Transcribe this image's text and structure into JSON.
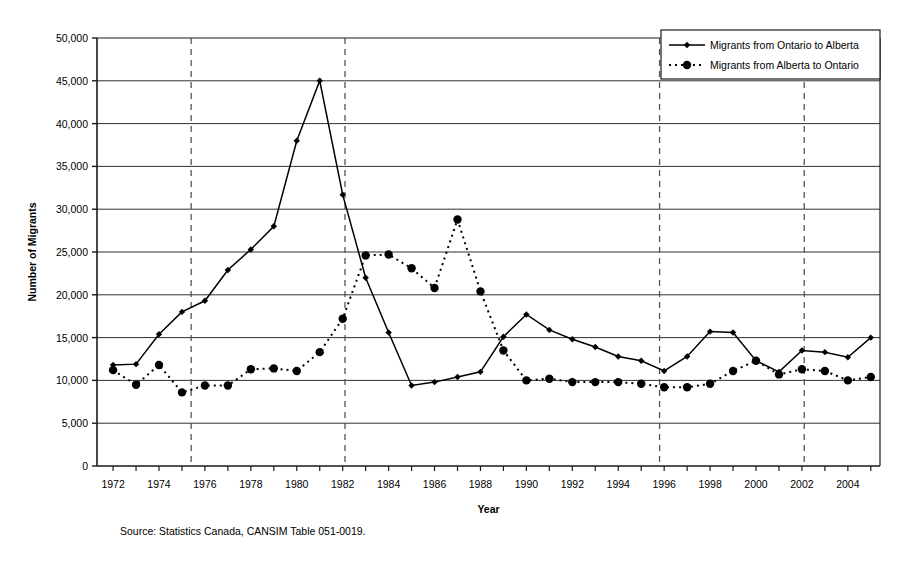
{
  "chart_data": {
    "type": "line",
    "title": "",
    "xlabel": "Year",
    "ylabel": "Number of Migrants",
    "xlim": [
      1971.3,
      2005.4
    ],
    "ylim": [
      0,
      50000
    ],
    "grid": "horizontal-solid-plus-dashed-vertical",
    "legend_position": "top-right",
    "x_tick_labels": [
      "1972",
      "1974",
      "1976",
      "1978",
      "1980",
      "1982",
      "1984",
      "1986",
      "1988",
      "1990",
      "1992",
      "1994",
      "1996",
      "1998",
      "2000",
      "2002",
      "2004"
    ],
    "x_tick_values": [
      1972,
      1974,
      1976,
      1978,
      1980,
      1982,
      1984,
      1986,
      1988,
      1990,
      1992,
      1994,
      1996,
      1998,
      2000,
      2002,
      2004
    ],
    "y_tick_labels": [
      "0",
      "5,000",
      "10,000",
      "15,000",
      "20,000",
      "25,000",
      "30,000",
      "35,000",
      "40,000",
      "45,000",
      "50,000"
    ],
    "y_tick_values": [
      0,
      5000,
      10000,
      15000,
      20000,
      25000,
      30000,
      35000,
      40000,
      45000,
      50000
    ],
    "dashed_vertical_years": [
      1975.4,
      1982.1,
      1995.8,
      2002.1
    ],
    "x": [
      1972,
      1973,
      1974,
      1975,
      1976,
      1977,
      1978,
      1979,
      1980,
      1981,
      1982,
      1983,
      1984,
      1985,
      1986,
      1987,
      1988,
      1989,
      1990,
      1991,
      1992,
      1993,
      1994,
      1995,
      1996,
      1997,
      1998,
      1999,
      2000,
      2001,
      2002,
      2003,
      2004,
      2005
    ],
    "series": [
      {
        "name": "Migrants from Ontario to Alberta",
        "style": "solid",
        "marker": "diamond",
        "color": "#000000",
        "values": [
          11800,
          11900,
          15400,
          18000,
          19300,
          22900,
          25300,
          28000,
          38000,
          45000,
          31700,
          22000,
          15600,
          9400,
          9800,
          10400,
          11000,
          15100,
          17700,
          15900,
          14800,
          13900,
          12800,
          12300,
          11100,
          12800,
          15700,
          15600,
          12300,
          11000,
          13500,
          13300,
          12700,
          15000
        ]
      },
      {
        "name": "Migrants from Alberta to Ontario",
        "style": "dotted",
        "marker": "circle",
        "color": "#000000",
        "values": [
          11200,
          9500,
          11800,
          8600,
          9400,
          9400,
          11300,
          11400,
          11100,
          13300,
          17200,
          24600,
          24700,
          23100,
          20800,
          28800,
          20400,
          13500,
          10000,
          10200,
          9800,
          9800,
          9800,
          9600,
          9200,
          9200,
          9600,
          11100,
          12300,
          10700,
          11300,
          11100,
          10000,
          10400
        ]
      }
    ]
  },
  "legend": {
    "items": [
      {
        "label": "Migrants from Ontario to Alberta",
        "style": "solid"
      },
      {
        "label": "Migrants from Alberta to Ontario",
        "style": "dotted"
      }
    ]
  },
  "axis": {
    "y_title": "Number of Migrants",
    "x_title": "Year"
  },
  "source": {
    "text": "Source: Statistics Canada, CANSIM Table 051-0019."
  }
}
